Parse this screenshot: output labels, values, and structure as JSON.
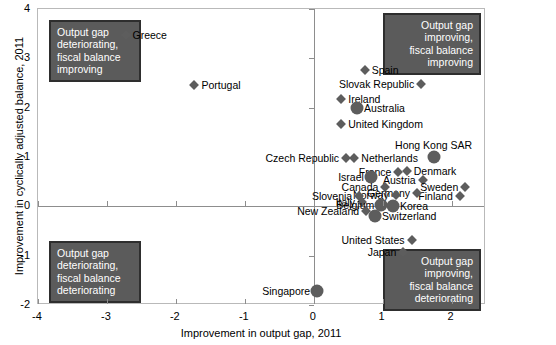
{
  "chart_data": {
    "type": "scatter",
    "title": "",
    "xlabel": "Improvement in output gap, 2011",
    "ylabel": "Improvement in cyclically adjusted balance, 2011",
    "xlim": [
      -4,
      2.5
    ],
    "ylim": [
      -2,
      4
    ],
    "xticks": [
      -4,
      -3,
      -2,
      -1,
      0,
      1,
      2
    ],
    "yticks": [
      -2,
      -1,
      0,
      1,
      2,
      3,
      4
    ],
    "xtick_labels": [
      "-4",
      "-3",
      "-2",
      "-1",
      "0",
      "1",
      "2"
    ],
    "ytick_labels": [
      "-2",
      "-1",
      "0",
      "1",
      "2",
      "3",
      "4"
    ],
    "grid": false,
    "legend": "none",
    "marker_color": "#5d5d5d",
    "points": [
      {
        "label": "Greece",
        "x": -2.73,
        "y": 3.47,
        "marker": "diamond",
        "label_side": "right"
      },
      {
        "label": "Portugal",
        "x": -1.73,
        "y": 2.45,
        "marker": "diamond",
        "label_side": "right"
      },
      {
        "label": "Spain",
        "x": 0.74,
        "y": 2.77,
        "marker": "diamond",
        "label_side": "right"
      },
      {
        "label": "Slovak Republic",
        "x": 1.56,
        "y": 2.47,
        "marker": "diamond",
        "label_side": "left"
      },
      {
        "label": "Ireland",
        "x": 0.4,
        "y": 2.17,
        "marker": "diamond",
        "label_side": "right"
      },
      {
        "label": "Australia",
        "x": 0.63,
        "y": 2.0,
        "marker": "circle",
        "label_side": "right"
      },
      {
        "label": "United Kingdom",
        "x": 0.4,
        "y": 1.66,
        "marker": "diamond",
        "label_side": "right"
      },
      {
        "label": "Czech Republic",
        "x": 0.47,
        "y": 0.97,
        "marker": "diamond",
        "label_side": "left"
      },
      {
        "label": "Netherlands",
        "x": 0.59,
        "y": 0.97,
        "marker": "diamond",
        "label_side": "right"
      },
      {
        "label": "Hong Kong SAR",
        "x": 1.74,
        "y": 1.01,
        "marker": "circle",
        "label_side": "above"
      },
      {
        "label": "France",
        "x": 1.23,
        "y": 0.69,
        "marker": "diamond",
        "label_side": "left"
      },
      {
        "label": "Israel",
        "x": 0.83,
        "y": 0.6,
        "marker": "circle",
        "label_side": "left"
      },
      {
        "label": "Denmark",
        "x": 1.35,
        "y": 0.71,
        "marker": "diamond",
        "label_side": "right"
      },
      {
        "label": "Austria",
        "x": 1.58,
        "y": 0.53,
        "marker": "diamond",
        "label_side": "left"
      },
      {
        "label": "Sweden",
        "x": 2.2,
        "y": 0.4,
        "marker": "diamond",
        "label_side": "left"
      },
      {
        "label": "Canada",
        "x": 1.04,
        "y": 0.4,
        "marker": "diamond",
        "label_side": "left"
      },
      {
        "label": "Finland",
        "x": 2.12,
        "y": 0.2,
        "marker": "diamond",
        "label_side": "left"
      },
      {
        "label": "Germany",
        "x": 1.5,
        "y": 0.28,
        "marker": "diamond",
        "label_side": "left"
      },
      {
        "label": "Norway",
        "x": 1.19,
        "y": 0.22,
        "marker": "diamond",
        "label_side": "left"
      },
      {
        "label": "Slovenia",
        "x": 0.66,
        "y": 0.2,
        "marker": "diamond",
        "label_side": "left"
      },
      {
        "label": "Italy",
        "x": 0.7,
        "y": 0.08,
        "marker": "diamond",
        "label_side": "left"
      },
      {
        "label": "Belgium",
        "x": 0.98,
        "y": 0.02,
        "marker": "circle",
        "label_side": "left"
      },
      {
        "label": "Korea",
        "x": 1.15,
        "y": 0.0,
        "marker": "circle",
        "label_side": "right"
      },
      {
        "label": "New Zealand",
        "x": 0.76,
        "y": -0.09,
        "marker": "diamond",
        "label_side": "left"
      },
      {
        "label": "Switzerland",
        "x": 0.89,
        "y": -0.2,
        "marker": "circle",
        "label_side": "right"
      },
      {
        "label": "United States",
        "x": 1.42,
        "y": -0.69,
        "marker": "diamond",
        "label_side": "left"
      },
      {
        "label": "Japan",
        "x": 1.3,
        "y": -0.93,
        "marker": "diamond",
        "label_side": "left"
      },
      {
        "label": "Singapore",
        "x": 0.05,
        "y": -1.72,
        "marker": "circle",
        "label_side": "left"
      }
    ],
    "annotations": [
      {
        "id": "top-left",
        "lines": [
          "Output gap",
          "deteriorating,",
          "fiscal balance",
          "improving"
        ]
      },
      {
        "id": "top-right",
        "lines": [
          "Output gap",
          "improving,",
          "fiscal balance",
          "improving"
        ]
      },
      {
        "id": "bottom-left",
        "lines": [
          "Output gap",
          "deteriorating,",
          "fiscal balance",
          "deteriorating"
        ]
      },
      {
        "id": "bottom-right",
        "lines": [
          "Output gap",
          "improving,",
          "fiscal balance",
          "deteriorating"
        ]
      }
    ]
  }
}
